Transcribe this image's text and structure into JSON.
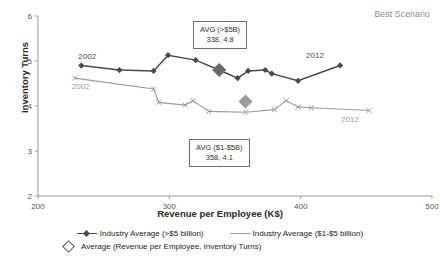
{
  "header": {
    "best_scenario_label": "Best Scenario"
  },
  "annotations": [
    {
      "id": "avg-high",
      "title": "AVG (>$5B)",
      "value": "338, 4.8"
    },
    {
      "id": "avg-low",
      "title": "AVG ($1-$5B)",
      "value": "358, 4.1"
    }
  ],
  "series_endpoint_labels": {
    "high_start": "2002",
    "high_end": "2012",
    "low_start": "2002",
    "low_end": "2012"
  },
  "legend": {
    "items": [
      {
        "label": "Industry Average (>$5 billion)",
        "color": "#4a4a4a",
        "marker": "filled-diamond"
      },
      {
        "label": "Industry Average ($1-$5 billion)",
        "color": "#9a9a9a",
        "marker": "line"
      },
      {
        "label": "Average (Revenue per Employee, Inventory Turns)",
        "color": "#555555",
        "marker": "open-diamond"
      }
    ]
  },
  "chart_data": {
    "type": "scatter",
    "title": "",
    "subtitle": "Best Scenario",
    "xlabel": "Revenue per Employee (K$)",
    "ylabel": "Inventory Turns",
    "xlim": [
      200,
      500
    ],
    "ylim": [
      2,
      6
    ],
    "xticks": [
      200,
      300,
      400,
      500
    ],
    "yticks": [
      2,
      3,
      4,
      5,
      6
    ],
    "grid": false,
    "legend_position": "bottom",
    "series": [
      {
        "name": "Industry Average (>$5 billion)",
        "color": "#4a4a4a",
        "marker": "filled-diamond",
        "start_label": "2002",
        "end_label": "2012",
        "points": [
          {
            "year": 2002,
            "x": 233,
            "y": 4.9
          },
          {
            "year": 2003,
            "x": 262,
            "y": 4.8
          },
          {
            "year": 2004,
            "x": 288,
            "y": 4.78
          },
          {
            "year": 2005,
            "x": 299,
            "y": 5.13
          },
          {
            "year": 2006,
            "x": 320,
            "y": 5.02
          },
          {
            "year": 2007,
            "x": 338,
            "y": 4.8
          },
          {
            "year": 2008,
            "x": 352,
            "y": 4.62
          },
          {
            "year": 2009,
            "x": 360,
            "y": 4.78
          },
          {
            "year": 2010,
            "x": 373,
            "y": 4.8
          },
          {
            "year": 2011,
            "x": 378,
            "y": 4.72
          },
          {
            "year": 2012,
            "x": 398,
            "y": 4.56
          },
          {
            "year": 2013,
            "x": 430,
            "y": 4.9
          }
        ]
      },
      {
        "name": "Industry Average ($1-$5 billion)",
        "color": "#9a9a9a",
        "marker": "cross",
        "start_label": "2002",
        "end_label": "2012",
        "points": [
          {
            "year": 2002,
            "x": 228,
            "y": 4.62
          },
          {
            "year": 2003,
            "x": 288,
            "y": 4.38
          },
          {
            "year": 2004,
            "x": 292,
            "y": 4.08
          },
          {
            "year": 2005,
            "x": 312,
            "y": 4.02
          },
          {
            "year": 2006,
            "x": 318,
            "y": 4.12
          },
          {
            "year": 2007,
            "x": 330,
            "y": 3.88
          },
          {
            "year": 2008,
            "x": 358,
            "y": 3.86
          },
          {
            "year": 2009,
            "x": 380,
            "y": 3.92
          },
          {
            "year": 2010,
            "x": 389,
            "y": 4.12
          },
          {
            "year": 2011,
            "x": 398,
            "y": 3.98
          },
          {
            "year": 2012,
            "x": 408,
            "y": 3.96
          },
          {
            "year": 2013,
            "x": 452,
            "y": 3.9
          }
        ]
      }
    ],
    "average_markers": [
      {
        "label": "AVG (>$5B)",
        "x": 338,
        "y": 4.8,
        "color": "#6b6b6b"
      },
      {
        "label": "AVG ($1-$5B)",
        "x": 358,
        "y": 4.1,
        "color": "#9a9a9a"
      }
    ]
  }
}
